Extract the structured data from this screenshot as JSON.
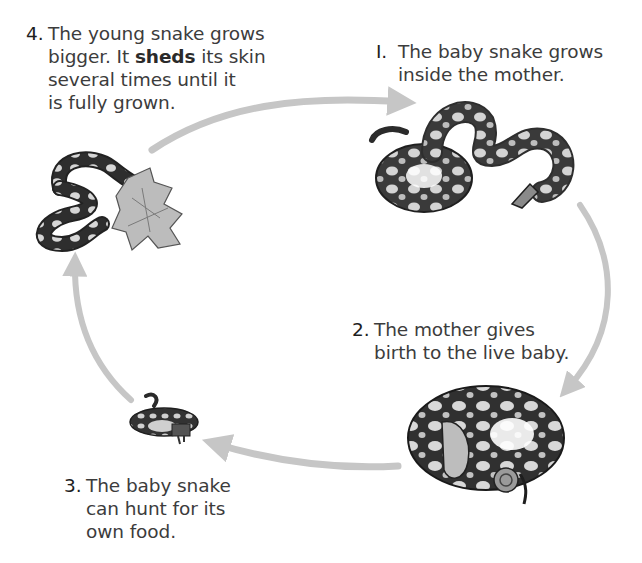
{
  "diagram": {
    "type": "life-cycle",
    "subject": "snake",
    "arrow_color": "#c4c4c4",
    "stages": [
      {
        "number": "I.",
        "lines": [
          "The baby snake grows",
          "inside the mother."
        ],
        "illustration": "adult-snake-coiled-icon"
      },
      {
        "number": "2.",
        "lines": [
          "The mother gives",
          "birth to the live baby."
        ],
        "illustration": "mother-snake-with-baby-icon"
      },
      {
        "number": "3.",
        "lines": [
          "The baby snake",
          "can hunt for its",
          "own food."
        ],
        "illustration": "baby-snake-eating-icon"
      },
      {
        "number": "4.",
        "lines_parts": [
          [
            "The young snake grows"
          ],
          [
            "bigger. It ",
            "sheds",
            " its skin"
          ],
          [
            "several times until it"
          ],
          [
            "is fully grown."
          ]
        ],
        "highlighted_word": "sheds",
        "illustration": "young-snake-shedding-skin-icon"
      }
    ]
  }
}
